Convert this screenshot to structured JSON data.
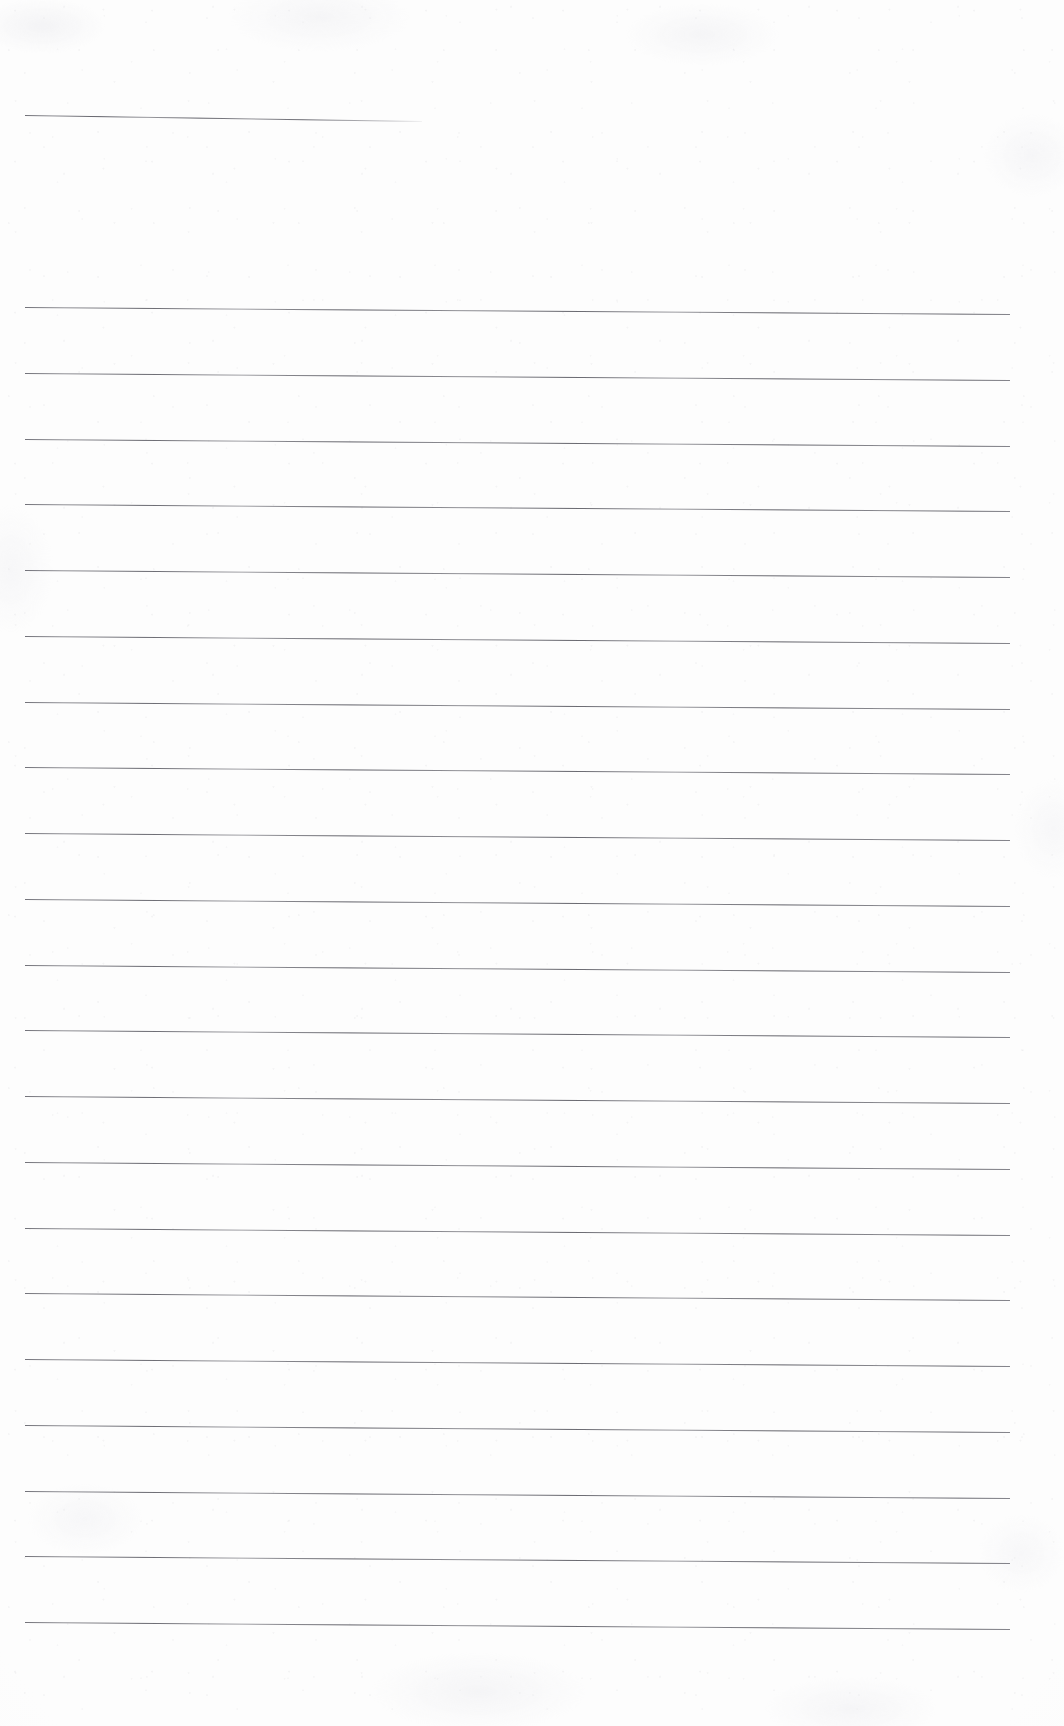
{
  "document": {
    "type": "blank-ruled-notebook-page",
    "title": "Blank Ruled Notebook Page",
    "written_text": "",
    "page_number": "",
    "header_text": "",
    "footer_text": ""
  },
  "page": {
    "width": 1064,
    "height": 1726,
    "background_color": "#fdfdfd",
    "has_margin_rule": false,
    "has_border": false
  },
  "ruling": {
    "line_color": "#6a6a72",
    "line_thickness": 1,
    "line_spacing": 65.75,
    "left_margin_x": 25,
    "right_margin_x": 1010,
    "first_line_y": 307,
    "last_line_y": 1622,
    "line_count": 21,
    "skew_px": 7,
    "skew_note": "lines drop about 7px from left edge to right edge"
  },
  "top_rule": {
    "label": "short rule",
    "x_start": 25,
    "x_end": 422,
    "y_start": 115,
    "y_end": 121,
    "width": 397,
    "fades_at_right": true
  },
  "lines": [
    {
      "index": 1,
      "y": 307
    },
    {
      "index": 2,
      "y": 373
    },
    {
      "index": 3,
      "y": 439
    },
    {
      "index": 4,
      "y": 504
    },
    {
      "index": 5,
      "y": 570
    },
    {
      "index": 6,
      "y": 636
    },
    {
      "index": 7,
      "y": 702
    },
    {
      "index": 8,
      "y": 767
    },
    {
      "index": 9,
      "y": 833
    },
    {
      "index": 10,
      "y": 899
    },
    {
      "index": 11,
      "y": 965
    },
    {
      "index": 12,
      "y": 1030
    },
    {
      "index": 13,
      "y": 1096
    },
    {
      "index": 14,
      "y": 1162
    },
    {
      "index": 15,
      "y": 1228
    },
    {
      "index": 16,
      "y": 1293
    },
    {
      "index": 17,
      "y": 1359
    },
    {
      "index": 18,
      "y": 1425
    },
    {
      "index": 19,
      "y": 1491
    },
    {
      "index": 20,
      "y": 1556
    },
    {
      "index": 21,
      "y": 1622
    }
  ]
}
